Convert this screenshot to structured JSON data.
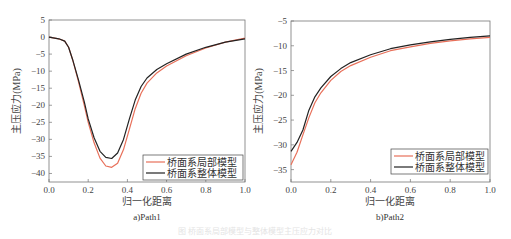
{
  "chart_data": [
    {
      "type": "line",
      "caption": "a)Path1",
      "xlabel": "归一化距离",
      "ylabel": "主压应力(MPa)",
      "xlim": [
        0.0,
        1.0
      ],
      "ylim": [
        -42.5,
        5
      ],
      "xticks": [
        "0.0",
        "0.2",
        "0.4",
        "0.6",
        "0.8",
        "1.0"
      ],
      "yticks": [
        "5",
        "0",
        "-5",
        "-10",
        "-15",
        "-20",
        "-25",
        "-30",
        "-35",
        "-40"
      ],
      "grid": false,
      "legend_position": "lower right",
      "series": [
        {
          "name": "桥面系局部模型",
          "color": "#e8705a",
          "x": [
            0.0,
            0.05,
            0.08,
            0.1,
            0.12,
            0.15,
            0.18,
            0.2,
            0.23,
            0.26,
            0.29,
            0.32,
            0.35,
            0.38,
            0.41,
            0.44,
            0.47,
            0.5,
            0.55,
            0.6,
            0.7,
            0.8,
            0.9,
            1.0
          ],
          "values": [
            0.0,
            -0.5,
            -1.2,
            -3.0,
            -6.5,
            -13.0,
            -20.0,
            -25.0,
            -31.0,
            -35.5,
            -37.8,
            -38.2,
            -37.0,
            -33.0,
            -27.0,
            -21.0,
            -16.5,
            -13.5,
            -10.5,
            -8.5,
            -5.5,
            -3.2,
            -1.5,
            -0.3
          ]
        },
        {
          "name": "桥面系整体模型",
          "color": "#222222",
          "x": [
            0.0,
            0.05,
            0.08,
            0.1,
            0.12,
            0.15,
            0.18,
            0.2,
            0.23,
            0.26,
            0.29,
            0.32,
            0.35,
            0.38,
            0.41,
            0.44,
            0.47,
            0.5,
            0.55,
            0.6,
            0.7,
            0.8,
            0.9,
            1.0
          ],
          "values": [
            0.0,
            -0.5,
            -1.2,
            -3.0,
            -6.5,
            -12.5,
            -19.0,
            -24.0,
            -29.5,
            -33.5,
            -35.3,
            -35.6,
            -34.0,
            -30.0,
            -24.0,
            -18.5,
            -14.5,
            -12.0,
            -9.5,
            -7.8,
            -5.0,
            -3.0,
            -1.5,
            -0.5
          ]
        }
      ]
    },
    {
      "type": "line",
      "caption": "b)Path2",
      "xlabel": "归一化距离",
      "ylabel": "主压应力(MPa)",
      "xlim": [
        0.0,
        1.0
      ],
      "ylim": [
        -37.5,
        -5
      ],
      "xticks": [
        "0.0",
        "0.2",
        "0.4",
        "0.6",
        "0.8",
        "1.0"
      ],
      "yticks": [
        "-5",
        "-10",
        "-15",
        "-20",
        "-25",
        "-30",
        "-35"
      ],
      "grid": false,
      "legend_position": "lower right",
      "series": [
        {
          "name": "桥面系局部模型",
          "color": "#e8705a",
          "x": [
            0.0,
            0.03,
            0.06,
            0.09,
            0.12,
            0.15,
            0.2,
            0.25,
            0.3,
            0.4,
            0.5,
            0.6,
            0.7,
            0.8,
            0.9,
            1.0
          ],
          "values": [
            -34.0,
            -31.5,
            -28.0,
            -24.5,
            -21.5,
            -19.5,
            -17.0,
            -15.2,
            -14.0,
            -12.3,
            -11.0,
            -10.2,
            -9.5,
            -9.0,
            -8.6,
            -8.3
          ]
        },
        {
          "name": "桥面系整体模型",
          "color": "#222222",
          "x": [
            0.0,
            0.03,
            0.06,
            0.09,
            0.12,
            0.15,
            0.2,
            0.25,
            0.3,
            0.4,
            0.5,
            0.6,
            0.7,
            0.8,
            0.9,
            1.0
          ],
          "values": [
            -31.3,
            -29.5,
            -27.0,
            -23.0,
            -20.3,
            -18.5,
            -16.2,
            -14.6,
            -13.4,
            -11.8,
            -10.6,
            -9.8,
            -9.2,
            -8.7,
            -8.3,
            -8.0
          ]
        }
      ]
    }
  ],
  "figure_caption_faint": "图 桥面系局部模型与整体模型主压应力对比"
}
